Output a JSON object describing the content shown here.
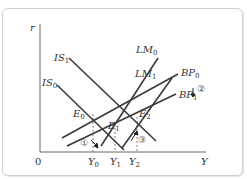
{
  "diagram": {
    "axes": {
      "y_label": "r",
      "x_label": "Y",
      "origin": "0"
    },
    "curves": [
      {
        "id": "IS1",
        "label": "IS",
        "sub": "1"
      },
      {
        "id": "IS0",
        "label": "IS",
        "sub": "0"
      },
      {
        "id": "LM0",
        "label": "LM",
        "sub": "0"
      },
      {
        "id": "LM1",
        "label": "LM",
        "sub": "1"
      },
      {
        "id": "BP0",
        "label": "BP",
        "sub": "0"
      },
      {
        "id": "BP1",
        "label": "BP",
        "sub": "1"
      }
    ],
    "points": [
      {
        "id": "E0",
        "label": "E",
        "sub": "0"
      },
      {
        "id": "E1",
        "label": "E",
        "sub": "1"
      },
      {
        "id": "E2",
        "label": "E",
        "sub": "2"
      }
    ],
    "x_ticks": [
      {
        "label": "Y",
        "sub": "0"
      },
      {
        "label": "Y",
        "sub": "1"
      },
      {
        "label": "Y",
        "sub": "2"
      }
    ],
    "steps": [
      "①",
      "②",
      "③"
    ],
    "colors": {
      "line": "#3a3a3a",
      "text": "#333333",
      "frame": "#cfcfcf"
    }
  }
}
